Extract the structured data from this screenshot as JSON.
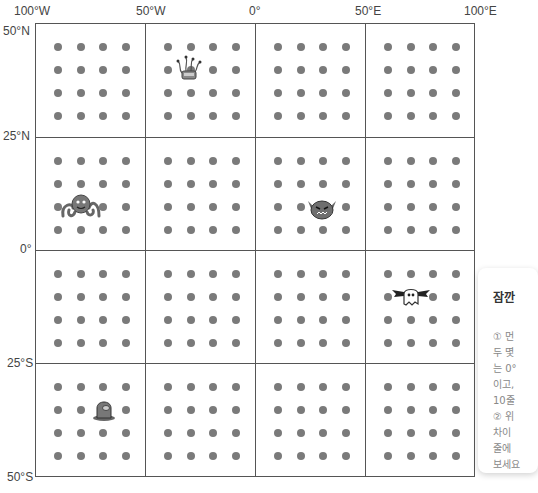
{
  "map": {
    "longitude_labels": [
      "100°W",
      "50°W",
      "0°",
      "50°E",
      "100°E"
    ],
    "latitude_labels": [
      "50°N",
      "25°N",
      "0°",
      "25°S",
      "50°S"
    ],
    "grid": {
      "rows": 4,
      "cols": 4,
      "dots_per_cell": 16
    },
    "colors": {
      "line": "#555555",
      "dot": "#7a7a7a"
    }
  },
  "characters": [
    {
      "name": "tentacle-robot",
      "cell": [
        0,
        1
      ]
    },
    {
      "name": "octopus",
      "cell": [
        1,
        0
      ]
    },
    {
      "name": "horned-monster",
      "cell": [
        1,
        2
      ]
    },
    {
      "name": "bat-ghost",
      "cell": [
        2,
        3
      ]
    },
    {
      "name": "helmet-blob",
      "cell": [
        3,
        0
      ]
    }
  ],
  "side_panel": {
    "title": "잠깐",
    "lines": [
      "① 먼",
      "두 몇",
      "는 0°",
      "이고,",
      "10줄",
      "② 위",
      "차이",
      "줄에",
      "보세요"
    ]
  }
}
